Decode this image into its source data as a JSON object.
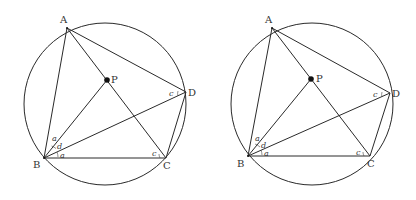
{
  "figures": [
    {
      "id": "left",
      "circle": {
        "cx": 105,
        "cy": 104,
        "r": 81
      },
      "points": {
        "A": {
          "x": 67,
          "y": 28,
          "label": "A",
          "lx": 60,
          "ly": 23
        },
        "P": {
          "x": 107,
          "y": 80,
          "label": "P",
          "lx": 111,
          "ly": 83
        },
        "D": {
          "x": 186,
          "y": 92,
          "label": "D",
          "lx": 188,
          "ly": 96
        },
        "B": {
          "x": 44,
          "y": 158,
          "label": "B",
          "lx": 33,
          "ly": 168
        },
        "C": {
          "x": 166,
          "y": 158,
          "label": "C",
          "lx": 163,
          "ly": 169
        }
      },
      "angle_labels": [
        {
          "text": "a",
          "x": 52,
          "y": 141
        },
        {
          "text": "d",
          "x": 57,
          "y": 149
        },
        {
          "text": "a",
          "x": 60,
          "y": 158
        },
        {
          "text": "c",
          "x": 152,
          "y": 156
        },
        {
          "text": "c",
          "x": 169,
          "y": 96
        }
      ]
    },
    {
      "id": "right",
      "circle": {
        "cx": 312,
        "cy": 104,
        "r": 81
      },
      "points": {
        "A": {
          "x": 272,
          "y": 28,
          "label": "A",
          "lx": 265,
          "ly": 23
        },
        "P": {
          "x": 311,
          "y": 79,
          "label": "P",
          "lx": 316,
          "ly": 82
        },
        "D": {
          "x": 390,
          "y": 93,
          "label": "D",
          "lx": 392,
          "ly": 97
        },
        "B": {
          "x": 248,
          "y": 156,
          "label": "B",
          "lx": 237,
          "ly": 167
        },
        "C": {
          "x": 370,
          "y": 156,
          "label": "C",
          "lx": 367,
          "ly": 167
        }
      },
      "angle_labels": [
        {
          "text": "a",
          "x": 255,
          "y": 141
        },
        {
          "text": "d",
          "x": 261,
          "y": 148
        },
        {
          "text": "a",
          "x": 264,
          "y": 156
        },
        {
          "text": "c",
          "x": 356,
          "y": 155
        },
        {
          "text": "c",
          "x": 373,
          "y": 97
        }
      ]
    }
  ],
  "segments": [
    [
      "A",
      "B"
    ],
    [
      "A",
      "D"
    ],
    [
      "A",
      "C"
    ],
    [
      "B",
      "P"
    ],
    [
      "B",
      "D"
    ],
    [
      "B",
      "C"
    ],
    [
      "C",
      "D"
    ]
  ],
  "text": {
    "left": {
      "A": "A",
      "P": "P",
      "D": "D",
      "B": "B",
      "C": "C",
      "a1": "a",
      "d": "d",
      "a2": "a",
      "cC": "c",
      "cD": "c"
    },
    "right": {
      "A": "A",
      "P": "P",
      "D": "D",
      "B": "B",
      "C": "C",
      "a1": "a",
      "d": "d",
      "a2": "a",
      "cC": "c",
      "cD": "c"
    }
  }
}
